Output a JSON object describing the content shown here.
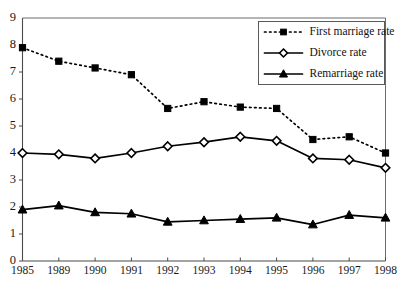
{
  "chart_data": {
    "type": "line",
    "title": "",
    "subtitle": "",
    "xlabel": "",
    "ylabel": "",
    "categories": [
      "1985",
      "1989",
      "1990",
      "1991",
      "1992",
      "1993",
      "1994",
      "1995",
      "1996",
      "1997",
      "1998"
    ],
    "ylim": [
      0,
      9
    ],
    "yticks": [
      "0",
      "1",
      "2",
      "3",
      "4",
      "5",
      "6",
      "7",
      "8",
      "9"
    ],
    "grid": false,
    "legend_position": "top-right",
    "series": [
      {
        "name": "First marriage rate",
        "marker": "filled-square",
        "linestyle": "dotted",
        "color": "#000000",
        "values": [
          7.9,
          7.4,
          7.15,
          6.9,
          5.65,
          5.9,
          5.7,
          5.65,
          4.5,
          4.6,
          4.0
        ]
      },
      {
        "name": "Divorce rate",
        "marker": "open-diamond",
        "linestyle": "solid",
        "color": "#000000",
        "values": [
          4.0,
          3.95,
          3.8,
          4.0,
          4.25,
          4.4,
          4.6,
          4.45,
          3.8,
          3.75,
          3.45
        ]
      },
      {
        "name": "Remarriage rate",
        "marker": "filled-triangle",
        "linestyle": "solid",
        "color": "#000000",
        "values": [
          1.9,
          2.05,
          1.8,
          1.75,
          1.45,
          1.5,
          1.55,
          1.6,
          1.35,
          1.7,
          1.6
        ]
      }
    ]
  },
  "legend": {
    "entries": [
      {
        "label": "First marriage rate"
      },
      {
        "label": "Divorce rate"
      },
      {
        "label": "Remarriage rate"
      }
    ]
  }
}
